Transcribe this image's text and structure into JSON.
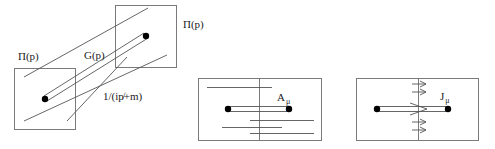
{
  "colors": {
    "stroke": "#555555",
    "box": "#7a7a7a",
    "dot": "#000000",
    "background": "#ffffff"
  },
  "left_diagram": {
    "label_pi_left": "Π(p)",
    "label_pi_right": "Π(p)",
    "label_propagator": "G(p)",
    "label_free": "1/(ip̸+m)"
  },
  "middle_diagram": {
    "label_field": "A",
    "label_field_sub": "μ"
  },
  "right_diagram": {
    "label_current": "J",
    "label_current_sub": "μ"
  }
}
